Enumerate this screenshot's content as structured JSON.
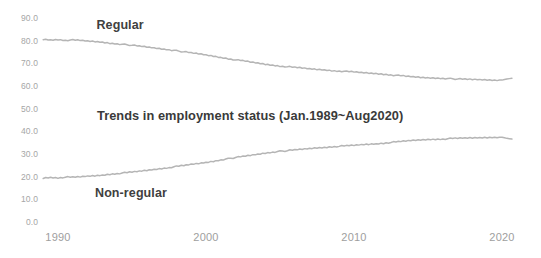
{
  "chart_data": {
    "type": "line",
    "title": "Trends in employment status (Jan.1989~Aug2020)",
    "xlabel": "",
    "ylabel": "",
    "grid": false,
    "legend_position": "inline-annotation",
    "xlim": [
      1989.0,
      2020.67
    ],
    "ylim": [
      0.0,
      90.0
    ],
    "yticks": [
      "90.0",
      "80.0",
      "70.0",
      "60.0",
      "50.0",
      "40.0",
      "30.0",
      "20.0",
      "10.0",
      "0.0"
    ],
    "ytick_values": [
      90,
      80,
      70,
      60,
      50,
      40,
      30,
      20,
      10,
      0
    ],
    "xticks": [
      "1990",
      "2000",
      "2010",
      "2020"
    ],
    "xtick_values": [
      1990,
      2000,
      2010,
      2020
    ],
    "units": "percent of employees",
    "series": [
      {
        "name": "Regular",
        "color": "#b5b5b5",
        "label_x": 1992.6,
        "label_y": 86.5,
        "x": [
          1989.0,
          1989.5,
          1990.0,
          1990.5,
          1991.0,
          1991.5,
          1992.0,
          1992.5,
          1993.0,
          1993.5,
          1994.0,
          1994.5,
          1995.0,
          1995.5,
          1996.0,
          1996.5,
          1997.0,
          1997.5,
          1998.0,
          1998.5,
          1999.0,
          1999.5,
          2000.0,
          2000.5,
          2001.0,
          2001.5,
          2002.0,
          2002.5,
          2003.0,
          2003.5,
          2004.0,
          2004.5,
          2005.0,
          2005.5,
          2006.0,
          2006.5,
          2007.0,
          2007.5,
          2008.0,
          2008.5,
          2009.0,
          2009.5,
          2010.0,
          2010.5,
          2011.0,
          2011.5,
          2012.0,
          2012.5,
          2013.0,
          2013.5,
          2014.0,
          2014.5,
          2015.0,
          2015.5,
          2016.0,
          2016.5,
          2017.0,
          2017.5,
          2018.0,
          2018.5,
          2019.0,
          2019.5,
          2020.0,
          2020.33,
          2020.67
        ],
        "y": [
          80.6,
          80.3,
          80.5,
          80.2,
          80.3,
          80.1,
          79.8,
          79.6,
          79.3,
          78.9,
          78.6,
          78.3,
          78.0,
          77.6,
          77.2,
          76.8,
          76.4,
          76.0,
          75.5,
          75.1,
          74.6,
          74.2,
          73.7,
          73.2,
          72.6,
          72.1,
          71.5,
          71.1,
          70.6,
          70.1,
          69.6,
          69.2,
          68.8,
          68.5,
          68.2,
          67.9,
          67.6,
          67.3,
          67.1,
          66.8,
          66.6,
          66.4,
          66.2,
          65.9,
          65.7,
          65.5,
          65.2,
          64.9,
          64.6,
          64.3,
          64.0,
          63.8,
          63.6,
          63.5,
          63.4,
          63.2,
          63.1,
          63.0,
          62.9,
          62.8,
          62.7,
          62.6,
          62.6,
          63.1,
          63.4
        ]
      },
      {
        "name": "Non-regular",
        "color": "#b5b5b5",
        "label_x": 1992.5,
        "label_y": 12.5,
        "x": [
          1989.0,
          1989.5,
          1990.0,
          1990.5,
          1991.0,
          1991.5,
          1992.0,
          1992.5,
          1993.0,
          1993.5,
          1994.0,
          1994.5,
          1995.0,
          1995.5,
          1996.0,
          1996.5,
          1997.0,
          1997.5,
          1998.0,
          1998.5,
          1999.0,
          1999.5,
          2000.0,
          2000.5,
          2001.0,
          2001.5,
          2002.0,
          2002.5,
          2003.0,
          2003.5,
          2004.0,
          2004.5,
          2005.0,
          2005.5,
          2006.0,
          2006.5,
          2007.0,
          2007.5,
          2008.0,
          2008.5,
          2009.0,
          2009.5,
          2010.0,
          2010.5,
          2011.0,
          2011.5,
          2012.0,
          2012.5,
          2013.0,
          2013.5,
          2014.0,
          2014.5,
          2015.0,
          2015.5,
          2016.0,
          2016.5,
          2017.0,
          2017.5,
          2018.0,
          2018.5,
          2019.0,
          2019.5,
          2020.0,
          2020.33,
          2020.67
        ],
        "y": [
          19.4,
          19.7,
          19.5,
          19.8,
          19.7,
          19.9,
          20.2,
          20.4,
          20.7,
          21.1,
          21.4,
          21.7,
          22.0,
          22.4,
          22.8,
          23.2,
          23.6,
          24.0,
          24.5,
          24.9,
          25.4,
          25.8,
          26.3,
          26.8,
          27.4,
          27.9,
          28.5,
          28.9,
          29.4,
          29.9,
          30.4,
          30.8,
          31.2,
          31.5,
          31.8,
          32.1,
          32.4,
          32.7,
          32.9,
          33.2,
          33.4,
          33.6,
          33.8,
          34.1,
          34.3,
          34.5,
          34.8,
          35.1,
          35.4,
          35.7,
          36.0,
          36.2,
          36.4,
          36.5,
          36.6,
          36.8,
          36.9,
          37.0,
          37.1,
          37.2,
          37.3,
          37.4,
          37.4,
          36.9,
          36.6
        ]
      }
    ]
  }
}
